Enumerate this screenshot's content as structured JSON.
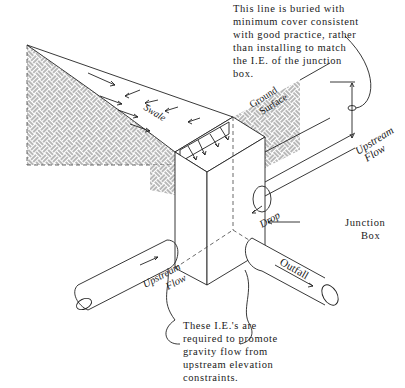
{
  "diagram": {
    "type": "isometric-junction-box-illustration",
    "notes": {
      "top": [
        "This line is buried with",
        "minimum cover consistent",
        "with good practice, rather",
        "than installing to match",
        "the I.E. of the junction",
        "box."
      ],
      "bottom": [
        "These I.E.'s are",
        "required to promote",
        "gravity flow from",
        "upstream elevation",
        "constraints."
      ]
    },
    "labels": {
      "swale": "Swale",
      "ground_1": "Ground",
      "ground_2": "Surface",
      "upstream_right_1": "Upstream",
      "upstream_right_2": "Flow",
      "drop": "Drop",
      "junction_1": "Junction",
      "junction_2": "Box",
      "upstream_left_1": "Upstream",
      "upstream_left_2": "Flow",
      "outfall": "Outfall"
    },
    "colors": {
      "line": "#222222",
      "background": "#ffffff"
    }
  }
}
